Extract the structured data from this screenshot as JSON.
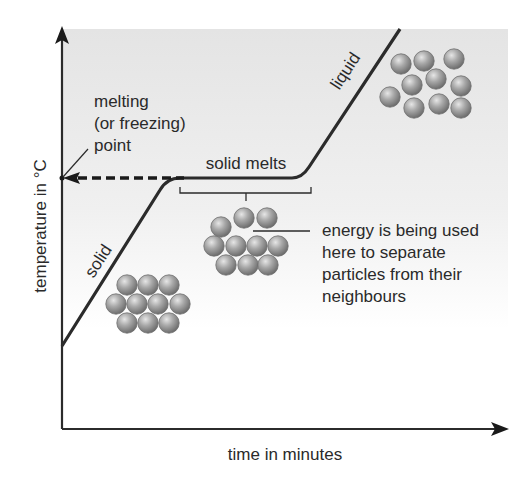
{
  "diagram": {
    "x_axis_label": "time in minutes",
    "y_axis_label": "temperature in °C",
    "melting_point_label": {
      "line1": "melting",
      "line2": "(or freezing)",
      "line3": "point"
    },
    "segment_labels": {
      "solid": "solid",
      "plateau": "solid melts",
      "liquid": "liquid"
    },
    "annotation": {
      "line1": "energy is being used",
      "line2": "here to separate",
      "line3": "particles from their",
      "line4": "neighbours"
    },
    "particle_groups": [
      {
        "name": "solid-particles",
        "arrangement": "regular lattice",
        "count": 10
      },
      {
        "name": "melting-particles",
        "arrangement": "partially separated",
        "count": 10
      },
      {
        "name": "liquid-particles",
        "arrangement": "irregular",
        "count": 10
      }
    ],
    "colors": {
      "line": "#2b2b2b",
      "background_top": "#e6e6e6",
      "background_bottom": "#ffffff",
      "particle": "#9a9a9a"
    }
  }
}
